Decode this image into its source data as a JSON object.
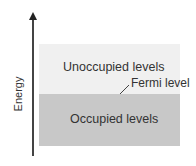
{
  "diagram": {
    "axis": {
      "label": "Energy",
      "direction": "up"
    },
    "regions": [
      {
        "name": "unoccupied",
        "label": "Unoccupied levels",
        "color": "#f0f0f0"
      },
      {
        "name": "occupied",
        "label": "Occupied levels",
        "color": "#c8c8c8"
      }
    ],
    "boundary": {
      "label": "Fermi level"
    }
  }
}
